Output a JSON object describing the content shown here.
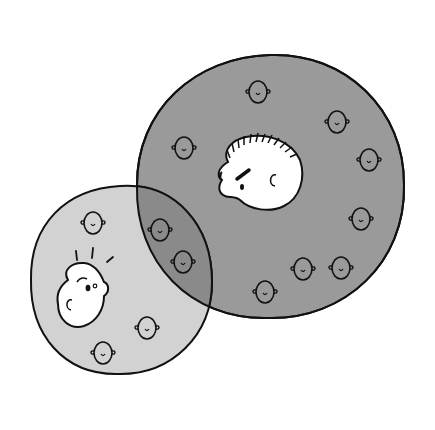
{
  "diagram": {
    "colors": {
      "background": "#ffffff",
      "large_group_fill": "#9a9a9a",
      "small_group_fill": "#d2d2d2",
      "overlap_fill": "#8a8a8a",
      "outline": "#111111",
      "face_fill": "#ffffff"
    },
    "large_group": {
      "label": "large-group",
      "center": [
        270,
        185
      ],
      "radius": 133,
      "hole_face": "frowning-man-with-spiky-hair",
      "small_faces": [
        {
          "x": 258,
          "y": 92
        },
        {
          "x": 337,
          "y": 122
        },
        {
          "x": 184,
          "y": 148
        },
        {
          "x": 369,
          "y": 160
        },
        {
          "x": 361,
          "y": 219
        },
        {
          "x": 160,
          "y": 230
        },
        {
          "x": 183,
          "y": 262
        },
        {
          "x": 303,
          "y": 269
        },
        {
          "x": 341,
          "y": 268
        },
        {
          "x": 265,
          "y": 292
        }
      ]
    },
    "small_group": {
      "label": "small-group",
      "center": [
        120,
        280
      ],
      "radius": 92,
      "featured_face": "surprised-person-looking-up",
      "small_faces": [
        {
          "x": 93,
          "y": 223
        },
        {
          "x": 147,
          "y": 328
        },
        {
          "x": 103,
          "y": 353
        }
      ]
    }
  }
}
